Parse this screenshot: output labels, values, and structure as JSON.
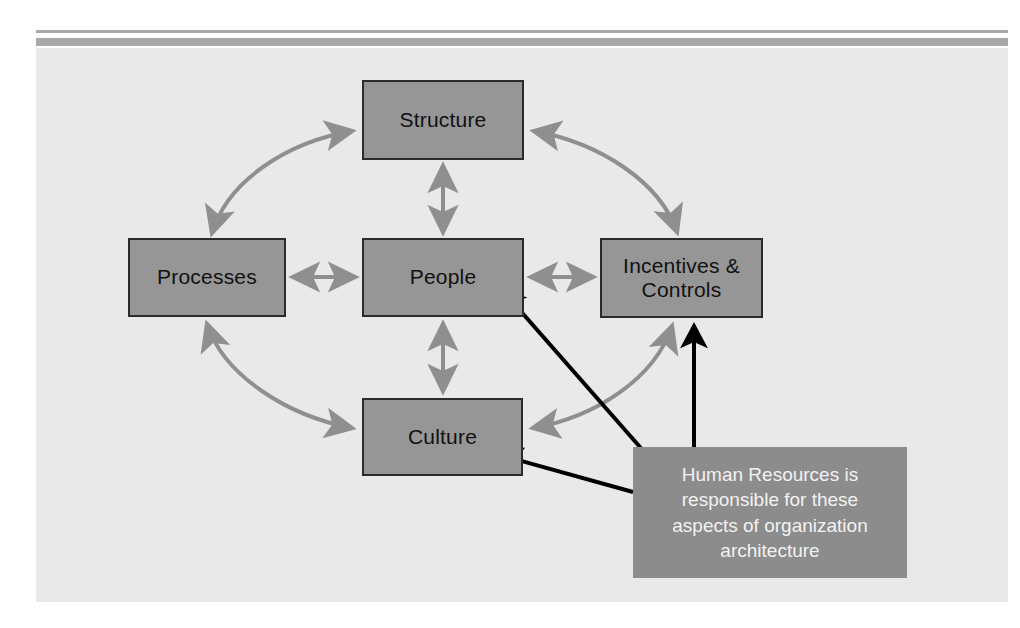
{
  "figure": {
    "title": "Organization Architecture",
    "background_color": "#e9e9e9",
    "page_color": "#ffffff",
    "rule_color": "#a8a8a8",
    "caption": ""
  },
  "nodes": [
    {
      "id": "structure",
      "label": "Structure",
      "fill": "#969696",
      "border": "#2b2b2b",
      "text_color": "#111111"
    },
    {
      "id": "processes",
      "label": "Processes",
      "fill": "#969696",
      "border": "#2b2b2b",
      "text_color": "#111111"
    },
    {
      "id": "people",
      "label": "People",
      "fill": "#969696",
      "border": "#2b2b2b",
      "text_color": "#111111"
    },
    {
      "id": "incentives",
      "label": "Incentives &\nControls",
      "fill": "#969696",
      "border": "#2b2b2b",
      "text_color": "#111111"
    },
    {
      "id": "culture",
      "label": "Culture",
      "fill": "#969696",
      "border": "#2b2b2b",
      "text_color": "#111111"
    }
  ],
  "node_labels": {
    "structure": "Structure",
    "processes": "Processes",
    "people": "People",
    "incentives_line1": "Incentives &",
    "incentives_line2": "Controls",
    "culture": "Culture"
  },
  "callout": {
    "text": "Human Resources is responsible for these aspects of organization architecture",
    "line1": "Human Resources is",
    "line2": "responsible for these",
    "line3": "aspects of organization",
    "line4": "architecture",
    "fill": "#8c8c8c",
    "text_color": "#f2f2f2",
    "points_to": [
      "people",
      "culture",
      "incentives"
    ]
  },
  "connectors": {
    "straight_color": "#8f8f8f",
    "curved_color": "#8f8f8f",
    "pointer_color": "#000000",
    "straight": [
      {
        "from": "structure",
        "to": "people",
        "style": "double-headed",
        "orientation": "vertical"
      },
      {
        "from": "processes",
        "to": "people",
        "style": "double-headed",
        "orientation": "horizontal"
      },
      {
        "from": "people",
        "to": "incentives",
        "style": "double-headed",
        "orientation": "horizontal"
      },
      {
        "from": "people",
        "to": "culture",
        "style": "double-headed",
        "orientation": "vertical"
      }
    ],
    "curved": [
      {
        "from": "processes",
        "to": "structure",
        "style": "double-headed",
        "arc": "upper-left"
      },
      {
        "from": "structure",
        "to": "incentives",
        "style": "double-headed",
        "arc": "upper-right"
      },
      {
        "from": "processes",
        "to": "culture",
        "style": "double-headed",
        "arc": "lower-left"
      },
      {
        "from": "culture",
        "to": "incentives",
        "style": "double-headed",
        "arc": "lower-right"
      }
    ],
    "pointers": [
      {
        "from": "callout",
        "to": "people",
        "style": "single-headed",
        "color": "#000000"
      },
      {
        "from": "callout",
        "to": "culture",
        "style": "single-headed",
        "color": "#000000"
      },
      {
        "from": "callout",
        "to": "incentives",
        "style": "single-headed",
        "color": "#000000"
      }
    ]
  }
}
